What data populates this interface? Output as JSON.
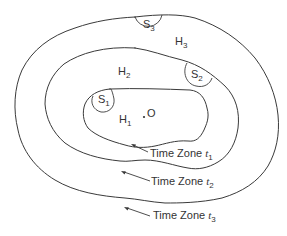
{
  "diagram": {
    "type": "nested-contours",
    "origin": {
      "label": "O"
    },
    "regions": [
      {
        "id": "H1",
        "label": "H",
        "subscript": "1"
      },
      {
        "id": "H2",
        "label": "H",
        "subscript": "2"
      },
      {
        "id": "H3",
        "label": "H",
        "subscript": "3"
      }
    ],
    "stations": [
      {
        "id": "S1",
        "label": "S",
        "subscript": "1"
      },
      {
        "id": "S2",
        "label": "S",
        "subscript": "2"
      },
      {
        "id": "S3",
        "label": "S",
        "subscript": "3"
      }
    ],
    "time_zones": [
      {
        "id": "t1",
        "label": "Time Zone ",
        "var": "t",
        "subscript": "1"
      },
      {
        "id": "t2",
        "label": "Time Zone ",
        "var": "t",
        "subscript": "2"
      },
      {
        "id": "t3",
        "label": "Time Zone ",
        "var": "t",
        "subscript": "3"
      }
    ],
    "colors": {
      "stroke": "#3a3a3a",
      "text": "#333333",
      "background": "#ffffff"
    }
  }
}
